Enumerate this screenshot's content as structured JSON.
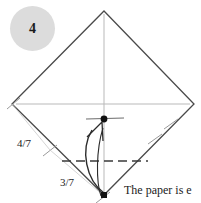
{
  "step": {
    "number": "4"
  },
  "caption": {
    "text": "The paper is e"
  },
  "measurements": [
    {
      "label": "4/7",
      "position": "upper-left-edge"
    },
    {
      "label": "3/7",
      "position": "lower-left-edge"
    }
  ],
  "diagram": {
    "shape": "square rotated 45 degrees (diamond)",
    "colors": {
      "outline": "#4a4a4a",
      "crease": "#b9b9b9",
      "fold_line": "#3a3a3a",
      "arrow": "#2b2b2b",
      "badge_fill": "#dcdcdc",
      "dot": "#111111",
      "text": "#1a1a1a"
    },
    "vertices": {
      "top": [
        104,
        11
      ],
      "left": [
        12,
        104
      ],
      "right": [
        194,
        104
      ],
      "bottom": [
        104,
        195
      ]
    },
    "center_dot": [
      104,
      119
    ],
    "bottom_dot": [
      104,
      195
    ],
    "fold_line_y": 161,
    "arrow_from": [
      104,
      195
    ],
    "arrow_to": [
      104,
      124
    ]
  }
}
